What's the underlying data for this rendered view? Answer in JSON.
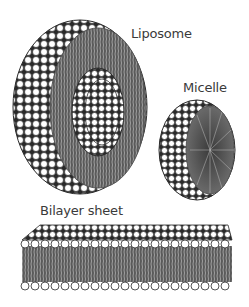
{
  "labels": {
    "liposome": "Liposome",
    "micelle": "Micelle",
    "bilayer": "Bilayer sheet"
  },
  "structures": [
    {
      "name": "liposome",
      "description": "spherical vesicle with lipid bilayer cutaway"
    },
    {
      "name": "micelle",
      "description": "spherical monolayer cutaway with tails inward"
    },
    {
      "name": "bilayer-sheet",
      "description": "flat lipid bilayer"
    }
  ],
  "colors": {
    "background": "#ffffff",
    "head_fill": "#ffffff",
    "head_stroke": "#2a2a2a",
    "tail": "#4a4a4a",
    "text": "#3a3a3a"
  }
}
